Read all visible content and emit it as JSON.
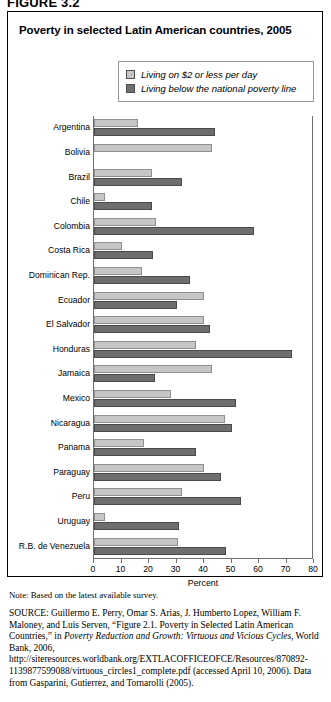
{
  "figure": {
    "label": "FIGURE 3.2"
  },
  "chart": {
    "title": "Poverty in selected Latin American countries, 2005",
    "legend": [
      {
        "label": "Living on $2 or less per day",
        "swatch": "light-grey-swatch-icon",
        "color": "#c6c6c6"
      },
      {
        "label": "Living below the national poverty line",
        "swatch": "dark-grey-swatch-icon",
        "color": "#6e6e6e"
      }
    ]
  },
  "chart_data": {
    "type": "bar",
    "orientation": "horizontal",
    "title": "Poverty in selected Latin American countries, 2005",
    "xlabel": "Percent",
    "ylabel": "",
    "xlim": [
      0,
      80
    ],
    "xticks": [
      0,
      10,
      20,
      30,
      40,
      50,
      60,
      70,
      80
    ],
    "grid": false,
    "legend_position": "top-right",
    "categories": [
      "Argentina",
      "Bolivia",
      "Brazil",
      "Chile",
      "Colombia",
      "Costa Rica",
      "Dominican Rep.",
      "Ecuador",
      "El Salvador",
      "Honduras",
      "Jamaica",
      "Mexico",
      "Nicaragua",
      "Panama",
      "Paraguay",
      "Peru",
      "Uruguay",
      "R.B. de Venezuela"
    ],
    "series": [
      {
        "name": "Living on $2 or less per day",
        "color": "#c6c6c6",
        "values": [
          16,
          43,
          21,
          4,
          22.5,
          10,
          17.5,
          40,
          40,
          37,
          43,
          28,
          47.5,
          18,
          40,
          32,
          4,
          30.5
        ]
      },
      {
        "name": "Living below the national poverty line",
        "color": "#6e6e6e",
        "values": [
          44,
          0,
          32,
          21,
          58,
          21.5,
          35,
          30,
          42,
          72,
          22,
          51.5,
          50,
          37,
          46,
          53.5,
          31,
          48
        ]
      }
    ]
  },
  "note": "Note: Based on the latest available survey.",
  "source": {
    "prefix": "SOURCE:",
    "text_1": " Guillermo E. Perry, Omar S. Arias, J. Humberto Lopez, William F. Maloney, and Luis Serven, “Figure 2.1. Poverty in Selected Latin American Countries,” in ",
    "italic_1": "Poverty Reduction and Growth: Virtuous and Vicious Cycles",
    "text_2": ", World Bank, 2006, http://siteresources.worldbank.org/EXTLACOFFICEOFCE/Resources/870892-1139877599088/virtuous_circles1_complete.pdf (accessed April 10, 2006). Data from Gasparini, Gutierrez, and Tornarolli (2005)."
  }
}
